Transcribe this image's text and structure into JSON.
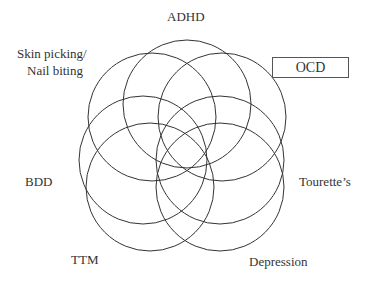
{
  "diagram": {
    "type": "overlapping-circles",
    "labels": {
      "adhd": "ADHD",
      "skin_picking_line1": "Skin picking/",
      "skin_picking_line2": "Nail biting",
      "ocd": "OCD",
      "bdd": "BDD",
      "tourettes": "Tourette’s",
      "ttm": "TTM",
      "depression": "Depression"
    },
    "highlighted": "OCD",
    "circles": [
      {
        "cx": 187,
        "cy": 104,
        "r": 64
      },
      {
        "cx": 222,
        "cy": 117,
        "r": 64
      },
      {
        "cx": 220,
        "cy": 160,
        "r": 64
      },
      {
        "cx": 220,
        "cy": 187,
        "r": 64
      },
      {
        "cx": 150,
        "cy": 187,
        "r": 64
      },
      {
        "cx": 143,
        "cy": 160,
        "r": 64
      },
      {
        "cx": 152,
        "cy": 117,
        "r": 64
      }
    ],
    "stroke_color": "#333333"
  }
}
